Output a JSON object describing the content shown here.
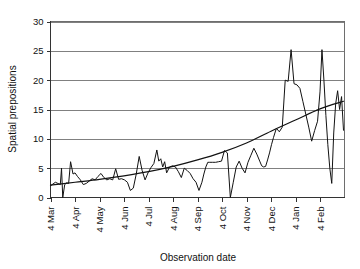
{
  "chart_data": {
    "type": "line",
    "title": "",
    "subtitle": "",
    "xlabel": "Observation date",
    "ylabel": "Spatial prepositions",
    "ylim": [
      0,
      30
    ],
    "yticks": [
      0,
      5,
      10,
      15,
      20,
      25,
      30
    ],
    "ytick_labels": [
      "0",
      "5",
      "10",
      "15",
      "20",
      "25",
      "30"
    ],
    "grid": "horizontal",
    "legend": "none",
    "xtick_labels": [
      "4 Mar",
      "4 Apr",
      "4 May",
      "4 Jun",
      "4 Jul",
      "4 Aug",
      "4 Sep",
      "4 Oct",
      "4 Nov",
      "4 Dec",
      "4 Jan",
      "4 Feb"
    ],
    "xtick_rotation": -90,
    "x_range_months": 12,
    "colors": {
      "series": "#121212",
      "trend": "#121212",
      "grid": "#808080",
      "frame": "#6e6e6e",
      "background": "#ffffff"
    },
    "series": [
      {
        "name": "Spatial prepositions observed",
        "style": "solid-thin",
        "x": [
          0.0,
          0.1,
          0.2,
          0.3,
          0.4,
          0.45,
          0.5,
          0.58,
          0.66,
          0.74,
          0.82,
          0.92,
          1.0,
          1.1,
          1.22,
          1.34,
          1.46,
          1.58,
          1.7,
          1.82,
          1.94,
          2.06,
          2.18,
          2.3,
          2.42,
          2.54,
          2.66,
          2.78,
          2.9,
          3.02,
          3.14,
          3.26,
          3.38,
          3.5,
          3.62,
          3.74,
          3.86,
          3.98,
          4.1,
          4.22,
          4.34,
          4.42,
          4.5,
          4.58,
          4.66,
          4.74,
          4.86,
          4.98,
          5.1,
          5.22,
          5.34,
          5.46,
          5.58,
          5.7,
          5.82,
          5.94,
          6.06,
          6.18,
          6.26,
          6.34,
          6.42,
          6.5,
          6.62,
          6.74,
          6.86,
          6.98,
          7.1,
          7.22,
          7.34,
          7.46,
          7.58,
          7.7,
          7.82,
          7.94,
          8.06,
          8.18,
          8.3,
          8.42,
          8.54,
          8.62,
          8.7,
          8.78,
          8.86,
          8.94,
          9.02,
          9.1,
          9.22,
          9.34,
          9.46,
          9.58,
          9.7,
          9.82,
          9.94,
          10.06,
          10.18,
          10.3,
          10.42,
          10.54,
          10.66,
          10.78,
          10.9,
          11.0,
          11.08,
          11.16,
          11.24,
          11.32,
          11.4,
          11.48,
          11.56,
          11.64,
          11.72,
          11.8,
          11.88,
          11.96
        ],
        "values": [
          2.0,
          2.3,
          2.6,
          2.4,
          2.2,
          5.0,
          0.0,
          2.2,
          2.5,
          2.4,
          6.1,
          4.0,
          4.2,
          3.6,
          3.0,
          2.2,
          2.4,
          2.8,
          3.2,
          3.0,
          3.6,
          4.1,
          3.4,
          3.0,
          3.2,
          3.0,
          4.9,
          3.1,
          3.2,
          3.0,
          2.6,
          1.2,
          1.6,
          4.0,
          7.0,
          4.6,
          3.0,
          4.2,
          5.1,
          5.8,
          8.1,
          6.2,
          6.6,
          5.2,
          6.1,
          4.2,
          5.2,
          5.4,
          5.2,
          4.4,
          3.4,
          5.0,
          4.6,
          4.1,
          3.2,
          2.6,
          1.2,
          2.6,
          4.0,
          5.2,
          6.0,
          6.0,
          6.0,
          6.0,
          6.1,
          6.2,
          8.0,
          7.6,
          0.0,
          2.6,
          5.2,
          6.2,
          5.0,
          4.2,
          6.0,
          7.2,
          8.4,
          7.4,
          6.2,
          5.4,
          5.2,
          5.3,
          6.4,
          7.6,
          9.0,
          10.2,
          11.8,
          11.2,
          12.0,
          20.0,
          19.8,
          25.2,
          19.4,
          19.2,
          18.6,
          16.4,
          14.2,
          12.0,
          9.6,
          11.4,
          13.0,
          18.0,
          25.2,
          20.0,
          14.0,
          9.0,
          5.0,
          2.4,
          11.0,
          16.0,
          18.2,
          15.0,
          17.2,
          11.4
        ]
      },
      {
        "name": "Trend (exponential fit)",
        "style": "smooth",
        "x": [
          0.0,
          1.0,
          2.0,
          3.0,
          4.0,
          5.0,
          6.0,
          7.0,
          8.0,
          9.0,
          10.0,
          11.0,
          11.96
        ],
        "values": [
          2.1,
          2.6,
          3.1,
          3.7,
          4.4,
          5.3,
          6.4,
          7.7,
          9.3,
          11.3,
          13.2,
          15.1,
          16.4
        ]
      }
    ]
  },
  "axes": {
    "y_title": "Spatial prepositions",
    "x_title": "Observation date"
  }
}
